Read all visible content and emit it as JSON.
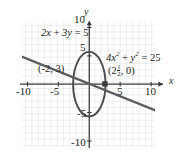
{
  "figure": {
    "kind": "coordinate-graph",
    "axes": {
      "x_label": "x",
      "y_label": "y",
      "x_ticks": [
        "-10",
        "-5",
        "5",
        "10"
      ],
      "y_ticks": [
        "10",
        "5",
        "-5",
        "-10"
      ],
      "x_range": [
        -10,
        10
      ],
      "y_range": [
        -10,
        10
      ],
      "grid": true,
      "grid_color": "#c9cbcd",
      "axis_color": "#3b3b3d"
    },
    "curves": [
      {
        "name": "line",
        "equation_parts": {
          "pre": "2x + 3y = 5"
        },
        "label": "2x + 3y = 5",
        "color": "#5c5c60"
      },
      {
        "name": "ellipse",
        "equation_parts": {
          "pre": "4x",
          "sup1": "2",
          "mid": " + y",
          "sup2": "2",
          "post": " = 25"
        },
        "label": "4x2 + y2 = 25",
        "color": "#4a4a4d"
      }
    ],
    "points": [
      {
        "name": "intersection-left",
        "label": "(-2, 3)",
        "x": -2,
        "y": 3
      },
      {
        "name": "intersection-right",
        "label": "(2 1/2 , 0)",
        "x": 2.5,
        "y": 0,
        "parts": {
          "open": "(2",
          "num": "1",
          "den": "2",
          "close": ", 0)"
        }
      }
    ]
  }
}
